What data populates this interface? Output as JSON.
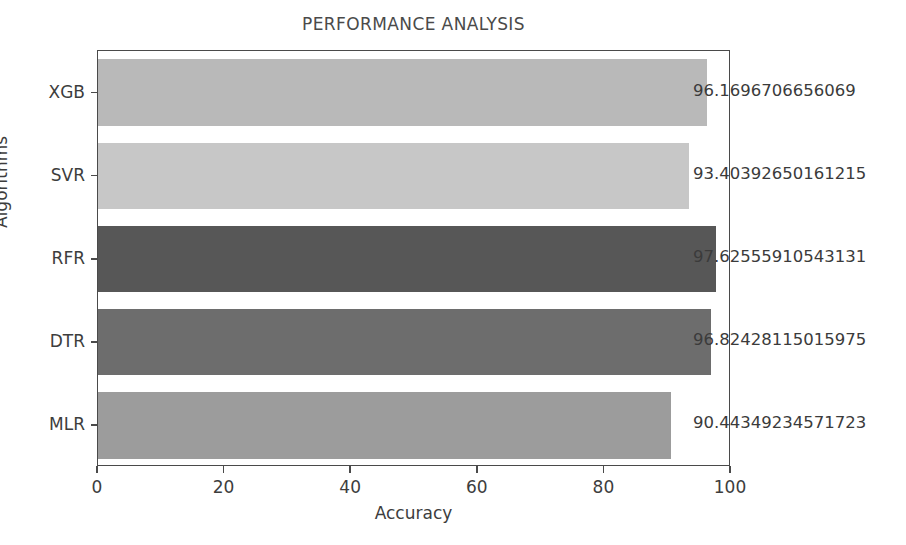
{
  "chart_data": {
    "type": "bar",
    "orientation": "horizontal",
    "title": "PERFORMANCE ANALYSIS",
    "xlabel": "Accuracy",
    "ylabel": "Algorithms",
    "categories": [
      "MLR",
      "DTR",
      "RFR",
      "SVR",
      "XGB"
    ],
    "values": [
      90.44349234571723,
      96.82428115015975,
      97.62555910543131,
      93.40392650161215,
      96.1696706656069
    ],
    "value_labels": [
      "90.44349234571723",
      "96.82428115015975",
      "97.62555910543131",
      "93.40392650161215",
      "96.1696706656069"
    ],
    "bar_colors": [
      "#9c9c9c",
      "#6d6d6d",
      "#575757",
      "#c7c7c7",
      "#b9b9b9"
    ],
    "xlim": [
      0,
      100
    ],
    "xticks": [
      0,
      20,
      40,
      60,
      80,
      100
    ],
    "xtick_labels": [
      "0",
      "20",
      "40",
      "60",
      "80",
      "100"
    ],
    "grid": false,
    "legend": "none",
    "bars": [
      {
        "category": "XGB",
        "value": 96.1696706656069,
        "label": "96.1696706656069",
        "color": "#b9b9b9"
      },
      {
        "category": "SVR",
        "value": 93.40392650161215,
        "label": "93.40392650161215",
        "color": "#c7c7c7"
      },
      {
        "category": "RFR",
        "value": 97.62555910543131,
        "label": "97.62555910543131",
        "color": "#575757"
      },
      {
        "category": "DTR",
        "value": 96.82428115015975,
        "label": "96.82428115015975",
        "color": "#6d6d6d"
      },
      {
        "category": "MLR",
        "value": 90.44349234571723,
        "label": "90.44349234571723",
        "color": "#9c9c9c"
      }
    ]
  },
  "axes": {
    "frame_color": "#4a4a4a"
  }
}
